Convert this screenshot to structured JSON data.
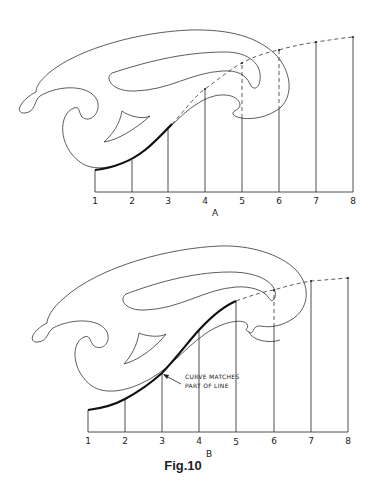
{
  "figure": {
    "caption": "Fig.10",
    "panels": [
      {
        "id": "A",
        "label": "A",
        "tick_labels": [
          "1",
          "2",
          "3",
          "4",
          "5",
          "6",
          "7",
          "8"
        ],
        "description": "French curve placed to match the start of the line through points 1-3; remaining points joined by dashed line"
      },
      {
        "id": "B",
        "label": "B",
        "tick_labels": [
          "1",
          "2",
          "3",
          "4",
          "5",
          "6",
          "7",
          "8"
        ],
        "annotation": {
          "line1": "CURVE MATCHES",
          "line2": "PART OF LINE"
        },
        "description": "French curve moved to match the line through points 1-5; remaining points joined by dashed line"
      }
    ]
  },
  "colors": {
    "line": "#222222",
    "background": "#ffffff"
  }
}
